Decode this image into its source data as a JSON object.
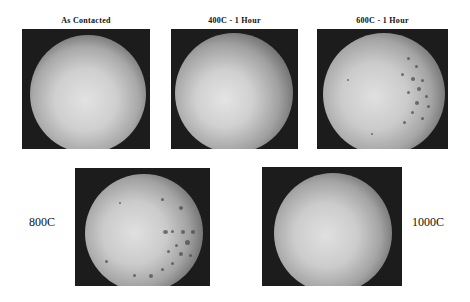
{
  "figure": {
    "panels": [
      {
        "id": "as-contacted",
        "caption": "As Contacted",
        "has_spots": false
      },
      {
        "id": "400c-1h",
        "caption": "400C - 1 Hour",
        "has_spots": false
      },
      {
        "id": "600c-1h",
        "caption": "600C - 1 Hour",
        "has_spots": true
      },
      {
        "id": "800c",
        "side_label": "800C",
        "has_spots": true
      },
      {
        "id": "1000c",
        "side_label": "1000C",
        "has_spots": false
      }
    ]
  }
}
